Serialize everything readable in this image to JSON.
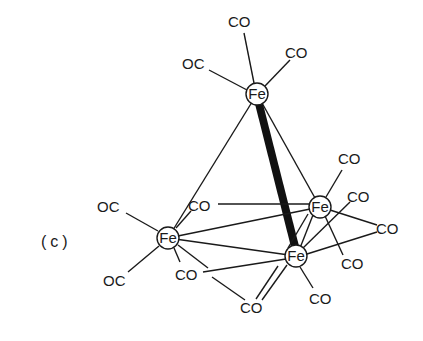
{
  "figure": {
    "panel_label": "(c)",
    "atoms": {
      "fe_top": {
        "label": "Fe",
        "x": 257,
        "y": 94
      },
      "fe_left": {
        "label": "Fe",
        "x": 168,
        "y": 238
      },
      "fe_right": {
        "label": "Fe",
        "x": 320,
        "y": 207
      },
      "fe_bottom": {
        "label": "Fe",
        "x": 296,
        "y": 256
      }
    },
    "ligands": {
      "top_co_up": {
        "label": "CO",
        "x": 237,
        "y": 21
      },
      "top_co_right": {
        "label": "CO",
        "x": 287,
        "y": 52
      },
      "top_oc_left": {
        "label": "OC",
        "x": 196,
        "y": 62
      },
      "left_oc_up": {
        "label": "OC",
        "x": 117,
        "y": 207
      },
      "left_oc_down": {
        "label": "OC",
        "x": 118,
        "y": 279
      },
      "bridge_co_upper": {
        "label": "CO",
        "x": 201,
        "y": 205
      },
      "bridge_co_lower": {
        "label": "CO",
        "x": 188,
        "y": 274
      },
      "bridge_co_bottom": {
        "label": "CO",
        "x": 251,
        "y": 306
      },
      "right_co_top": {
        "label": "CO",
        "x": 349,
        "y": 158
      },
      "right_co_mid": {
        "label": "CO",
        "x": 358,
        "y": 196
      },
      "right_co_far": {
        "label": "CO",
        "x": 386,
        "y": 228
      },
      "right_co_low": {
        "label": "CO",
        "x": 353,
        "y": 263
      },
      "bottom_co": {
        "label": "CO",
        "x": 320,
        "y": 298
      }
    }
  }
}
